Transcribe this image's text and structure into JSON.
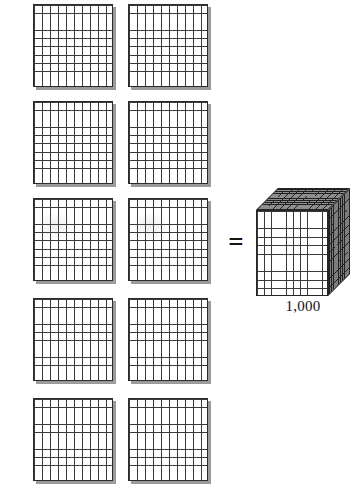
{
  "diagram": {
    "concept": "place-value",
    "relation_symbol": "=",
    "background_color": "#ffffff",
    "line_color": "#3a3a3a",
    "shadow_color": "#9b9b9b",
    "shaded_face_color": "#8e8e8e"
  },
  "flats": {
    "group_label": "hundred-flats",
    "count": 10,
    "columns": 2,
    "rows": 5,
    "each_value": 100,
    "grid_rows": 10,
    "grid_cols": 10,
    "cells_each": 100,
    "total_value": 1000,
    "items": [
      {
        "index": 1,
        "value": 100,
        "x": 33,
        "y": 4
      },
      {
        "index": 2,
        "value": 100,
        "x": 128,
        "y": 4
      },
      {
        "index": 3,
        "value": 100,
        "x": 33,
        "y": 101
      },
      {
        "index": 4,
        "value": 100,
        "x": 128,
        "y": 101
      },
      {
        "index": 5,
        "value": 100,
        "x": 33,
        "y": 198
      },
      {
        "index": 6,
        "value": 100,
        "x": 128,
        "y": 198
      },
      {
        "index": 7,
        "value": 100,
        "x": 33,
        "y": 298
      },
      {
        "index": 8,
        "value": 100,
        "x": 128,
        "y": 298
      },
      {
        "index": 9,
        "value": 100,
        "x": 33,
        "y": 398
      },
      {
        "index": 10,
        "value": 100,
        "x": 128,
        "y": 398
      }
    ]
  },
  "equals": {
    "symbol": "=",
    "meaning": "is equal to"
  },
  "cube": {
    "label": "1,000",
    "value": 1000,
    "name": "thousand-cube",
    "dimensions": "10 x 10 x 10",
    "faces": [
      "top",
      "front",
      "right"
    ]
  }
}
